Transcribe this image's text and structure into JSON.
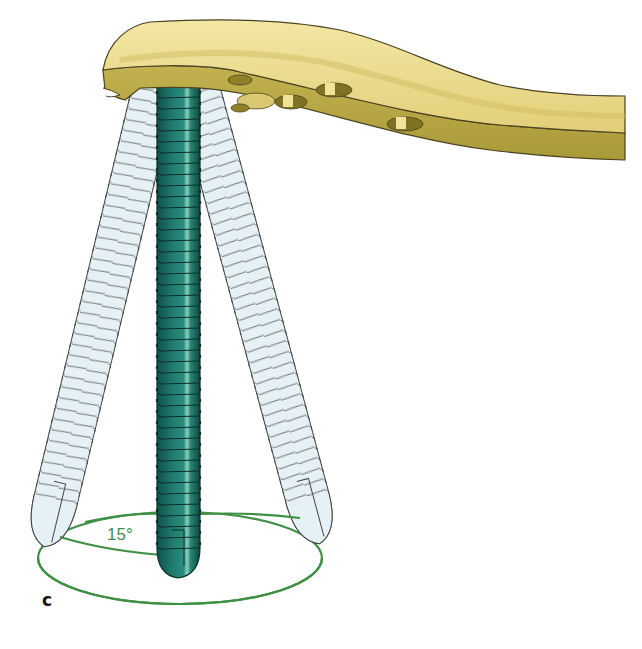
{
  "figure": {
    "panel_label": "c",
    "angle_label": "15°",
    "elements": {
      "plate": "bone-plate",
      "central_screw": "locking-screw",
      "angled_screws": [
        "left-angled-screw",
        "right-angled-screw"
      ],
      "cone": "angulation-cone"
    },
    "colors": {
      "plate_top": "#ecdc8c",
      "plate_side": "#b7a844",
      "plate_outline": "#4a4220",
      "screw_central": "#1f7a6c",
      "screw_central_highlight": "#7fc3b5",
      "screw_ghost": "#e4f0f4",
      "screw_outline": "#333333",
      "cone_line": "#3f8f44"
    }
  }
}
